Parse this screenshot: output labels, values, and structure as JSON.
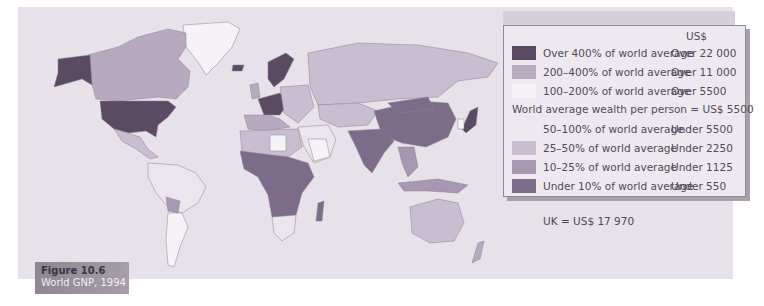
{
  "figure": {
    "number": "Figure 10.6",
    "title": "World GNP, 1994"
  },
  "legend": {
    "currency_header": "US$",
    "average_note": "World average wealth per person = US$ 5500",
    "above": [
      {
        "label": "Over 400% of world average",
        "value": "Over 22 000",
        "color": "#5a4a63"
      },
      {
        "label": "200–400% of world average",
        "value": "Over 11 000",
        "color": "#b7a9c0"
      },
      {
        "label": "100–200% of world average",
        "value": "Over 5500",
        "color": "#f6f3f8"
      }
    ],
    "below": [
      {
        "label": "50–100% of world average",
        "value": "Under 5500",
        "color": "#eee9f1"
      },
      {
        "label": "25–50% of world average",
        "value": "Under 2250",
        "color": "#c9bdd1"
      },
      {
        "label": "10–25% of world average",
        "value": "Under 1125",
        "color": "#a797b2"
      },
      {
        "label": "Under 10% of world average",
        "value": "Under 550",
        "color": "#7d6c89"
      }
    ]
  },
  "note": "UK = US$ 17 970",
  "colors": {
    "ocean": "#e7e1ea",
    "over400": "#5a4a63",
    "c200_400": "#b7a9c0",
    "c100_200": "#f6f3f8",
    "c50_100": "#ebe5ee",
    "c25_50": "#c9bdd1",
    "c10_25": "#a797b2",
    "under10": "#7d6c89"
  }
}
